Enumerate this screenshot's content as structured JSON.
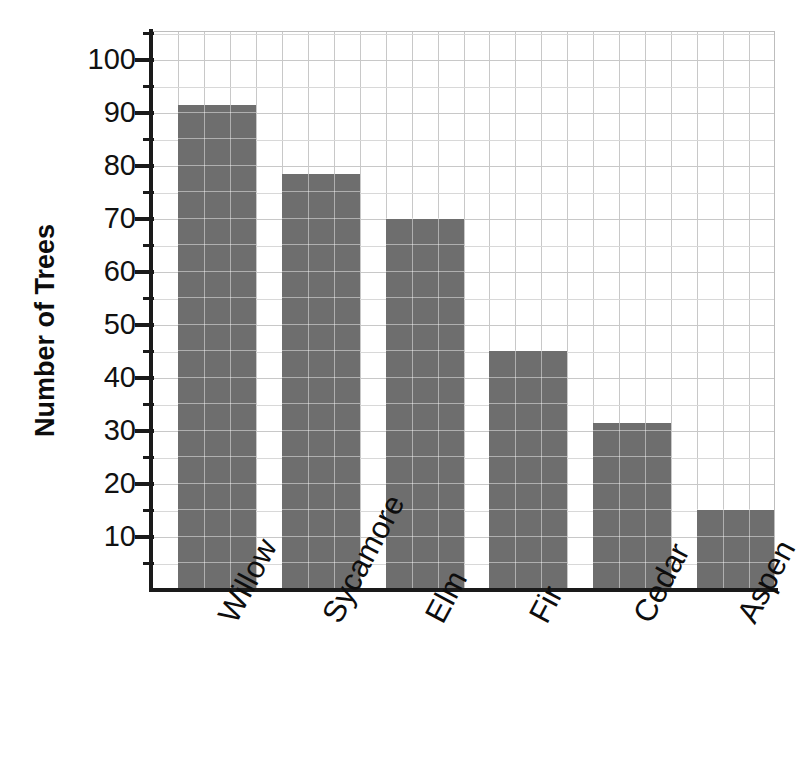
{
  "chart_data": {
    "type": "bar",
    "title": "",
    "subtitle": "",
    "xlabel": "",
    "ylabel": "Number of Trees",
    "categories": [
      "Willow",
      "Sycamore",
      "Elm",
      "Fir",
      "Cedar",
      "Aspen"
    ],
    "values": [
      91.5,
      78.5,
      70,
      45,
      31.5,
      15
    ],
    "ylim": [
      0,
      105
    ],
    "y_ticks": [
      10,
      20,
      30,
      40,
      50,
      60,
      70,
      80,
      90,
      100
    ],
    "y_tick_labels": [
      "10",
      "20",
      "30",
      "40",
      "50",
      "60",
      "70",
      "80",
      "90",
      "100"
    ],
    "y_minor_step": 5,
    "grid": true,
    "legend": "none",
    "bar_color": "#6e6e6e",
    "grid_color": "#c8c8c8",
    "axis_color": "#1a1a1a",
    "background_color": "#ffffff",
    "annotations": []
  },
  "axis": {
    "y_title": "Number of Trees"
  }
}
